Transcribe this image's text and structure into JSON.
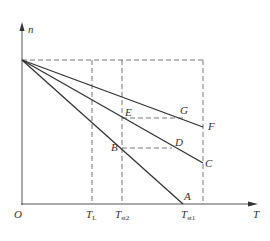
{
  "diagram": {
    "type": "mechanical characteristic n-T diagram",
    "axes": {
      "y_label": "n",
      "x_label": "T",
      "origin_label": "O"
    },
    "x_ticks": [
      {
        "main": "T",
        "sub": "L"
      },
      {
        "main": "T",
        "sub": "st2"
      },
      {
        "main": "T",
        "sub": "st1"
      }
    ],
    "points": {
      "A": "A",
      "B": "B",
      "C": "C",
      "D": "D",
      "E": "E",
      "F": "F",
      "G": "G"
    },
    "lines": [
      {
        "name": "characteristic-to-A",
        "from": [
          22,
          60
        ],
        "to": [
          183,
          204
        ]
      },
      {
        "name": "characteristic-to-C",
        "from": [
          22,
          60
        ],
        "to": [
          203,
          163
        ]
      },
      {
        "name": "characteristic-to-F",
        "from": [
          22,
          60
        ],
        "to": [
          203,
          127
        ]
      }
    ],
    "colors": {
      "line": "#333333",
      "dashed": "#666666",
      "background": "#ffffff"
    }
  }
}
